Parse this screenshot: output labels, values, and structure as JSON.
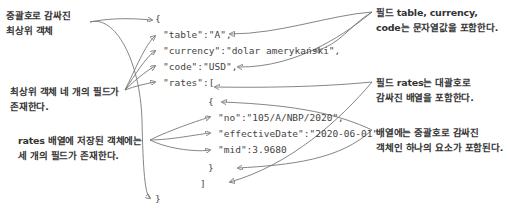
{
  "annotations": {
    "top_object": {
      "line1": "중괄호로 감싸진",
      "line2": "최상위 객체"
    },
    "four_fields": {
      "line1": "최상위 객체 네 개의 필드가",
      "line2": "존재한다."
    },
    "rates_fields": {
      "line1": "rates 배열에 저장된 객체에는",
      "line2": "세 개의 필드가 존재한다."
    },
    "string_fields": {
      "line1": "필드 table, currency,",
      "line2": "code는 문자열값을 포함한다."
    },
    "rates_array": {
      "line1": "필드 rates는 대괄호로",
      "line2": "감싸진 배열을 포함한다."
    },
    "array_element": {
      "line1": "배열에는 중괄호로 감싸진",
      "line2": "객체인 하나의 요소가 포함된다."
    }
  },
  "json_lines": {
    "open_brace": "{",
    "table": "\"table\":\"A\",",
    "currency": "\"currency\":\"dolar amerykański\",",
    "code": "\"code\":\"USD\",",
    "rates": "\"rates\":[",
    "inner_open": "{",
    "no": "\"no\":\"105/A/NBP/2020\",",
    "effectiveDate": "\"effectiveDate\":\"2020-06-01\",",
    "mid": "\"mid\":3.9680",
    "inner_close": "}",
    "array_close": "]",
    "close_brace": "}"
  },
  "colors": {
    "text": "#333333",
    "code": "#444444",
    "arrow": "#777777"
  }
}
